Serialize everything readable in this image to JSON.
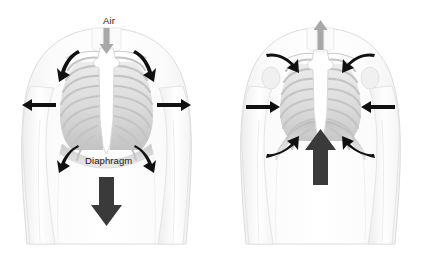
{
  "figure": {
    "background_color": "#ffffff",
    "width": 427,
    "height": 256
  },
  "colors": {
    "body_outline": "#d9d9d9",
    "body_fill": "#fcfcfc",
    "rib_fill": "#ffffff",
    "rib_outline": "#c8c8c8",
    "lung_shadow": "#b4b4b4",
    "sternum": "#ffffff",
    "dark_arrow": "#3a3a3a",
    "gray_arrow": "#a8a8a8",
    "label_text": "#1a1a1a"
  },
  "panels": [
    {
      "id": "inhalation",
      "name": "inhalation-panel",
      "labels": {
        "air": "Air",
        "diaphragm": "Diaphragm"
      },
      "arrows": {
        "trachea": {
          "name": "air-inflow-arrow",
          "direction": "down",
          "color": "#a8a8a8"
        },
        "shoulder_left": {
          "name": "rib-elevation-arrow-left",
          "direction": "up-left-curved",
          "color": "#1a1a1a"
        },
        "shoulder_right": {
          "name": "rib-elevation-arrow-right",
          "direction": "up-right-curved",
          "color": "#1a1a1a"
        },
        "side_left": {
          "name": "chest-expansion-arrow-left",
          "direction": "left",
          "color": "#1a1a1a"
        },
        "side_right": {
          "name": "chest-expansion-arrow-right",
          "direction": "right",
          "color": "#1a1a1a"
        },
        "lower_left": {
          "name": "lower-rib-arrow-left",
          "direction": "down-left-curved",
          "color": "#1a1a1a"
        },
        "lower_right": {
          "name": "lower-rib-arrow-right",
          "direction": "down-right-curved",
          "color": "#1a1a1a"
        },
        "diaphragm": {
          "name": "diaphragm-descent-arrow",
          "direction": "down",
          "color": "#3a3a3a"
        }
      }
    },
    {
      "id": "exhalation",
      "name": "exhalation-panel",
      "labels": {},
      "arrows": {
        "trachea": {
          "name": "air-outflow-arrow",
          "direction": "up",
          "color": "#a8a8a8"
        },
        "shoulder_left": {
          "name": "rib-depression-arrow-left",
          "direction": "down-right-curved",
          "color": "#1a1a1a"
        },
        "shoulder_right": {
          "name": "rib-depression-arrow-right",
          "direction": "down-left-curved",
          "color": "#1a1a1a"
        },
        "side_left": {
          "name": "chest-contraction-arrow-left",
          "direction": "right",
          "color": "#1a1a1a"
        },
        "side_right": {
          "name": "chest-contraction-arrow-right",
          "direction": "left",
          "color": "#1a1a1a"
        },
        "lower_left": {
          "name": "lower-rib-arrow-left",
          "direction": "up-right-curved",
          "color": "#1a1a1a"
        },
        "lower_right": {
          "name": "lower-rib-arrow-right",
          "direction": "up-left-curved",
          "color": "#1a1a1a"
        },
        "diaphragm": {
          "name": "diaphragm-ascent-arrow",
          "direction": "up",
          "color": "#3a3a3a"
        }
      }
    }
  ],
  "anatomy": {
    "rib_pair_count": 9,
    "parts": [
      "torso",
      "shoulders",
      "arms",
      "rib-cage",
      "sternum",
      "clavicle",
      "lungs",
      "diaphragm"
    ]
  }
}
